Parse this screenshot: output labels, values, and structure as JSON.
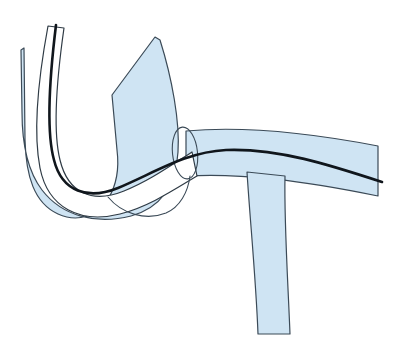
{
  "figure": {
    "title": "Vessel catheter junction illustration",
    "kind": "line-drawing",
    "canvas": {
      "width": 416,
      "height": 354,
      "background": "#ffffff"
    },
    "palette": {
      "vessel_fill": "#cfe4f3",
      "vessel_outline": "#3b4a57",
      "catheter_fill": "#ffffff",
      "catheter_outline": "#2f3b45",
      "guidewire": "#10161c",
      "background": "#ffffff"
    },
    "strokes": {
      "outline_width": 1.2,
      "catheter_wall_width": 1.2,
      "guidewire_width": 2.6
    },
    "parts": [
      {
        "name": "descending-vessel-limb",
        "label": "Descending vessel limb (upper left band)",
        "role": "vessel",
        "fill": "#cfe4f3",
        "stroke": "#3b4a57",
        "stroke_width": 1.2,
        "path": "M 24 48 L 25 140 C 26 176 34 203 58 214 C 78 223 97 216 108 199 C 118 183 119 166 117 150 L 112 95 L 155 37 L 160 40 C 172 78 180 122 178 152 C 176 186 160 208 131 216 C 96 225 62 216 42 190 C 26 169 22 140 22 112 L 21 50 Z"
      },
      {
        "name": "horizontal-vessel-trunk",
        "label": "Horizontal vessel trunk (right)",
        "role": "vessel",
        "fill": "#cfe4f3",
        "stroke": "#3b4a57",
        "stroke_width": 1.2,
        "path": "M 186 131 C 240 126 300 131 378 146 L 378 196 C 300 180 240 173 186 176 Z"
      },
      {
        "name": "vessel-side-branch",
        "label": "Descending side branch",
        "role": "vessel",
        "fill": "#cfe4f3",
        "stroke": "#3b4a57",
        "stroke_width": 1.2,
        "path": "M 247 172 C 250 220 256 280 258 334 L 290 334 C 288 282 284 222 285 176 Z"
      },
      {
        "name": "catheter-shaft-channel",
        "label": "Catheter shaft (white channel)",
        "role": "catheter",
        "fill": "#ffffff",
        "stroke": "#2f3b45",
        "stroke_width": 1.2,
        "path": "M 64 28 C 56 84 53 132 60 160 C 68 193 92 204 124 191 C 149 181 170 166 192 152 L 197 176 C 172 191 148 207 120 214 C 80 224 48 208 40 168 C 33 132 38 80 48 26 Z"
      },
      {
        "name": "guidewire",
        "label": "Guidewire (dark inner line)",
        "role": "wire",
        "stroke": "#10161c",
        "stroke_width": 2.6,
        "fill": "none",
        "path": "M 56 25 C 49 82 46 131 54 160 C 62 192 88 200 118 188 C 156 172 186 152 226 150 C 278 148 330 165 382 182"
      },
      {
        "name": "junction-ellipse",
        "label": "Vessel junction cross-section ellipse",
        "role": "junction",
        "fill": "none",
        "stroke": "#3b4a57",
        "stroke_width": 1.1,
        "ellipse": {
          "cx": 185,
          "cy": 153,
          "rx": 12.5,
          "ry": 26,
          "rotate": -6
        }
      },
      {
        "name": "lower-lobe-edge",
        "label": "Lower vessel lobe edge",
        "role": "vessel-edge",
        "fill": "none",
        "stroke": "#3b4a57",
        "stroke_width": 1.1,
        "path": "M 108 197 C 122 214 146 221 166 213 C 180 207 188 192 190 176"
      }
    ]
  }
}
